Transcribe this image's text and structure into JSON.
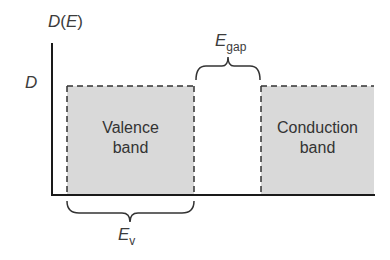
{
  "diagram": {
    "y_axis_label": {
      "main": "D",
      "paren_open": "(",
      "var": "E",
      "paren_close": ")"
    },
    "y_tick_label": "D",
    "bands": [
      {
        "name": "valence",
        "line1": "Valence",
        "line2": "band",
        "fill": "#d9d9d9"
      },
      {
        "name": "conduction",
        "line1": "Conduction",
        "line2": "band",
        "fill": "#d9d9d9"
      }
    ],
    "gap_label": {
      "main": "E",
      "sub": "gap"
    },
    "valence_width_label": {
      "main": "E",
      "sub": "v"
    },
    "colors": {
      "axis": "#1a1a1a",
      "band_fill": "#d9d9d9",
      "dash": "#333333",
      "brace": "#333333"
    }
  }
}
